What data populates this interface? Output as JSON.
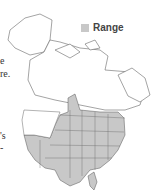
{
  "legend": {
    "label": "Range",
    "swatch_color": "#c8c8c8"
  },
  "text_fragments": [
    "e",
    "re.",
    "'s",
    "-"
  ],
  "map": {
    "region": "North America",
    "range_fill": "#c8c8c8",
    "border_color": "#555555"
  }
}
